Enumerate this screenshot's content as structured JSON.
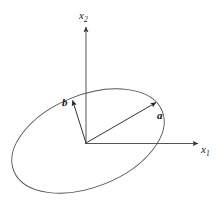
{
  "figure": {
    "background_color": "#ffffff",
    "stroke_color": "#555555",
    "text_color": "#1a1a1a",
    "axes": {
      "origin": {
        "x": 85,
        "y": 144
      },
      "x1": {
        "label_text": "x",
        "label_sub": "1",
        "name": "x1-axis",
        "from": {
          "x": 85,
          "y": 144
        },
        "to": {
          "x": 200,
          "y": 143
        },
        "arrow": "end"
      },
      "x2": {
        "label_text": "x",
        "label_sub": "2",
        "name": "x2-axis",
        "from": {
          "x": 86,
          "y": 144
        },
        "to": {
          "x": 86,
          "y": 25
        },
        "arrow": "end"
      }
    },
    "ellipse": {
      "name": "ellipse",
      "center": {
        "x": 88,
        "y": 141
      },
      "radius_x": 80,
      "radius_y": 46,
      "rotation_deg": -22,
      "fill": "none",
      "stroke": "#555555",
      "stroke_width": 0.9
    },
    "vectors": [
      {
        "name": "vector-a",
        "label": "a",
        "from": {
          "x": 86,
          "y": 143
        },
        "to": {
          "x": 158,
          "y": 101
        },
        "label_position": {
          "x": 157,
          "y": 110
        },
        "arrow": "end"
      },
      {
        "name": "vector-b",
        "label": "b",
        "from": {
          "x": 86,
          "y": 143
        },
        "to": {
          "x": 72,
          "y": 98
        },
        "label_position": {
          "x": 62,
          "y": 97
        },
        "arrow": "end"
      }
    ]
  }
}
